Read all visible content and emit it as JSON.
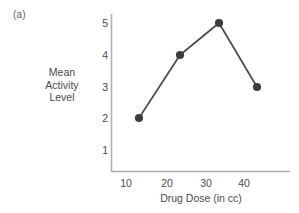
{
  "panel": {
    "label": "(a)"
  },
  "chart_data": {
    "type": "line",
    "title": "",
    "subtitle": "",
    "xlabel": "Drug Dose (in cc)",
    "ylabel": "Mean Activity Level",
    "ylabel_lines": [
      "Mean",
      "Activity",
      "Level"
    ],
    "categories": [
      10,
      20,
      30,
      40
    ],
    "x": [
      10,
      20,
      30,
      40
    ],
    "values": [
      2,
      4,
      5,
      3
    ],
    "series": [
      {
        "name": "Mean Activity Level",
        "values": [
          2,
          4,
          5,
          3
        ]
      }
    ],
    "xticklabels": [
      "10",
      "20",
      "30",
      "40"
    ],
    "yticklabels": [
      "1",
      "2",
      "3",
      "4",
      "5"
    ],
    "ytickvalues": [
      1,
      2,
      3,
      4,
      5
    ],
    "xlim": [
      5,
      47
    ],
    "ylim": [
      0.3,
      5.45
    ],
    "grid": false,
    "legend": false,
    "legend_position": "none",
    "marker": "circle",
    "line_color": "#4a4a4a",
    "marker_color": "#3d3d3d",
    "axis_color": "#b0b0b0",
    "background": "#ffffff"
  },
  "axis": {
    "y_ticks": [
      {
        "label": "5",
        "top": 23
      },
      {
        "label": "4",
        "top": 55
      },
      {
        "label": "3",
        "top": 87
      },
      {
        "label": "2",
        "top": 118
      },
      {
        "label": "1",
        "top": 150
      }
    ],
    "x_ticks": [
      {
        "label": "10",
        "left": 139
      },
      {
        "label": "20",
        "left": 180
      },
      {
        "label": "30",
        "left": 219
      },
      {
        "label": "40",
        "left": 257
      }
    ]
  }
}
